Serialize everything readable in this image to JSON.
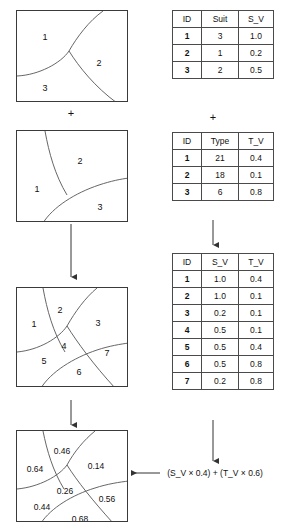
{
  "diagram": {
    "operators": {
      "plus": "+"
    },
    "formula": "(S_V × 0.4) + (T_V × 0.6)"
  },
  "maps": {
    "soil": {
      "name": "soil-map",
      "regions": [
        {
          "label": "1",
          "x": 28,
          "y": 26
        },
        {
          "label": "2",
          "x": 82,
          "y": 52
        },
        {
          "label": "3",
          "x": 28,
          "y": 77
        }
      ]
    },
    "type": {
      "name": "type-map",
      "regions": [
        {
          "label": "1",
          "x": 20,
          "y": 58
        },
        {
          "label": "2",
          "x": 63,
          "y": 30
        },
        {
          "label": "3",
          "x": 83,
          "y": 76
        }
      ]
    },
    "overlay": {
      "name": "overlay-map",
      "regions": [
        {
          "label": "1",
          "x": 17,
          "y": 36
        },
        {
          "label": "2",
          "x": 43,
          "y": 22
        },
        {
          "label": "3",
          "x": 81,
          "y": 35
        },
        {
          "label": "4",
          "x": 47,
          "y": 58
        },
        {
          "label": "5",
          "x": 27,
          "y": 73
        },
        {
          "label": "6",
          "x": 62,
          "y": 84
        },
        {
          "label": "7",
          "x": 90,
          "y": 65
        }
      ]
    },
    "result": {
      "name": "result-map",
      "regions": [
        {
          "label": "0.46",
          "x": 45,
          "y": 20
        },
        {
          "label": "0.64",
          "x": 18,
          "y": 38
        },
        {
          "label": "0.14",
          "x": 79,
          "y": 35
        },
        {
          "label": "0.26",
          "x": 48,
          "y": 60
        },
        {
          "label": "0.56",
          "x": 90,
          "y": 68
        },
        {
          "label": "0.44",
          "x": 25,
          "y": 76
        },
        {
          "label": "0.68",
          "x": 63,
          "y": 88
        }
      ]
    }
  },
  "tables": {
    "suit": {
      "name": "suitability-table",
      "headers": [
        "ID",
        "Suit",
        "S_V"
      ],
      "rows": [
        [
          "1",
          "3",
          "1.0"
        ],
        [
          "2",
          "1",
          "0.2"
        ],
        [
          "3",
          "2",
          "0.5"
        ]
      ]
    },
    "type": {
      "name": "type-table",
      "headers": [
        "ID",
        "Type",
        "T_V"
      ],
      "rows": [
        [
          "1",
          "21",
          "0.4"
        ],
        [
          "2",
          "18",
          "0.1"
        ],
        [
          "3",
          "6",
          "0.8"
        ]
      ]
    },
    "joined": {
      "name": "joined-table",
      "headers": [
        "ID",
        "S_V",
        "T_V"
      ],
      "rows": [
        [
          "1",
          "1.0",
          "0.4"
        ],
        [
          "2",
          "1.0",
          "0.1"
        ],
        [
          "3",
          "0.2",
          "0.1"
        ],
        [
          "4",
          "0.5",
          "0.1"
        ],
        [
          "5",
          "0.5",
          "0.4"
        ],
        [
          "6",
          "0.5",
          "0.8"
        ],
        [
          "7",
          "0.2",
          "0.8"
        ]
      ]
    }
  }
}
